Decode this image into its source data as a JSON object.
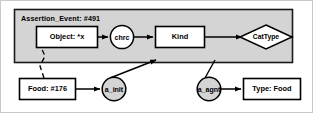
{
  "diagram": {
    "type": "conceptual-graph",
    "panel": {
      "label": "Assertion_Event: #491",
      "fill": "#d4d4d4",
      "stroke": "#1a1a1a"
    },
    "nodes": [
      {
        "id": "object",
        "shape": "rect",
        "label": "Object: *x",
        "x": 36,
        "y": 26,
        "w": 62,
        "h": 22,
        "fill": "#ffffff",
        "stroke": "#000000"
      },
      {
        "id": "chrc",
        "shape": "circle",
        "label": "chrc",
        "x": 110,
        "y": 26,
        "w": 24,
        "h": 24,
        "fill": "#ffffff",
        "stroke": "#000000"
      },
      {
        "id": "kind",
        "shape": "rect",
        "label": "Kind",
        "x": 155,
        "y": 26,
        "w": 50,
        "h": 22,
        "fill": "#ffffff",
        "stroke": "#000000"
      },
      {
        "id": "cattype",
        "shape": "diamond",
        "label": "CatType",
        "x": 240,
        "y": 25,
        "w": 52,
        "h": 24,
        "fill": "#ffffff",
        "stroke": "#000000"
      },
      {
        "id": "food",
        "shape": "rect",
        "label": "Food: #176",
        "x": 19,
        "y": 78,
        "w": 57,
        "h": 22,
        "fill": "#ffffff",
        "stroke": "#000000"
      },
      {
        "id": "a_init",
        "shape": "circle",
        "label": "a_init",
        "x": 102,
        "y": 77,
        "w": 24,
        "h": 24,
        "fill": "#d4d4d4",
        "stroke": "#000000"
      },
      {
        "id": "a_agnt",
        "shape": "circle",
        "label": "a_agnt",
        "x": 197,
        "y": 77,
        "w": 24,
        "h": 24,
        "fill": "#d4d4d4",
        "stroke": "#000000"
      },
      {
        "id": "typefood",
        "shape": "rect",
        "label": "Type: Food",
        "x": 243,
        "y": 78,
        "w": 58,
        "h": 22,
        "fill": "#ffffff",
        "stroke": "#000000"
      }
    ],
    "edges": [
      {
        "id": "object-to-chrc",
        "from": "object",
        "to": "chrc",
        "style": "solid",
        "arrow": true
      },
      {
        "id": "chrc-to-kind",
        "from": "chrc",
        "to": "kind",
        "style": "solid",
        "arrow": true
      },
      {
        "id": "kind-to-cattype",
        "from": "kind",
        "to": "cattype",
        "style": "solid",
        "arrow": true
      },
      {
        "id": "food-to-object",
        "from": "food",
        "to": "object",
        "style": "dashed",
        "arrow": false
      },
      {
        "id": "food-to-a_init",
        "from": "food",
        "to": "a_init",
        "style": "solid",
        "arrow": true
      },
      {
        "id": "a_init-to-panel",
        "from": "a_init",
        "to": "panel",
        "style": "solid",
        "arrow": true
      },
      {
        "id": "panel-to-a_agnt",
        "from": "panel",
        "to": "a_agnt",
        "style": "solid",
        "arrow": false
      },
      {
        "id": "a_agnt-to-typefood",
        "from": "a_agnt",
        "to": "typefood",
        "style": "solid",
        "arrow": true
      }
    ]
  }
}
